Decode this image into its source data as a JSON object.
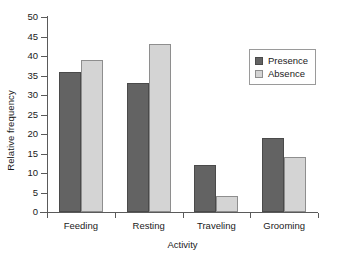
{
  "chart_data": {
    "type": "bar",
    "title": "",
    "xlabel": "Activity",
    "ylabel": "Relative frequency",
    "categories": [
      "Feeding",
      "Resting",
      "Traveling",
      "Grooming"
    ],
    "series": [
      {
        "name": "Presence",
        "color": "#636363",
        "values": [
          36,
          33,
          12,
          19
        ]
      },
      {
        "name": "Absence",
        "color": "#d4d4d4",
        "values": [
          39,
          43,
          4,
          14
        ]
      }
    ],
    "ylim": [
      0,
      50
    ],
    "ytick_step": 5,
    "ytick_labels": [
      "0",
      "5",
      "10",
      "15",
      "20",
      "25",
      "30",
      "35",
      "40",
      "45",
      "50"
    ],
    "grid": false,
    "legend_position": "top-right"
  },
  "legend": {
    "entries": [
      {
        "label": "Presence"
      },
      {
        "label": "Absence"
      }
    ]
  },
  "axes": {
    "x_title": "Activity",
    "y_title": "Relative frequency"
  }
}
